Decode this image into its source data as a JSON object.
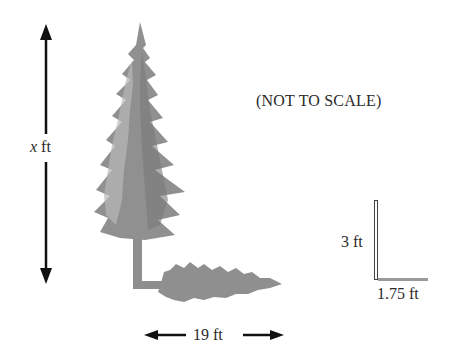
{
  "diagram": {
    "note": "(NOT TO SCALE)",
    "tree_height_label_var": "x",
    "tree_height_label_unit": " ft",
    "shadow_length_label": "19 ft",
    "pole_height_label": "3 ft",
    "pole_shadow_label": "1.75 ft"
  },
  "colors": {
    "tree": "#8a8a8a",
    "tree_light": "#b5b5b5",
    "arrow": "#111111",
    "pole": "#555555"
  }
}
